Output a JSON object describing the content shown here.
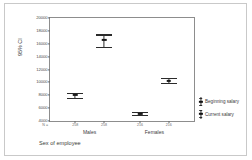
{
  "chart_data": {
    "type": "scatter",
    "title": "",
    "xlabel": "Sex of employee",
    "ylabel": "95% CI",
    "ylim": [
      4000,
      20000
    ],
    "yticks": [
      20000,
      18000,
      16000,
      14000,
      12000,
      10000,
      8000,
      6000,
      4000
    ],
    "ytick_labels": [
      "20000",
      "18000",
      "16000",
      "14000",
      "12000",
      "10000",
      "8000",
      "6000",
      "4000"
    ],
    "grid": false,
    "legend_position": "right",
    "n_prefix": "N =",
    "categories": [
      "Males",
      "Females"
    ],
    "series": [
      {
        "name": "Beginning salary",
        "n": [
          "258",
          "216"
        ],
        "means": [
          8000,
          5150
        ],
        "ci_lower": [
          7600,
          4950
        ],
        "ci_upper": [
          8400,
          5350
        ]
      },
      {
        "name": "Current salary",
        "n": [
          "258",
          "216"
        ],
        "means": [
          16600,
          10250
        ],
        "ci_lower": [
          15550,
          9900
        ],
        "ci_upper": [
          17450,
          10700
        ]
      }
    ],
    "points": [
      {
        "group": "Males",
        "series": "Beginning salary",
        "n": "258",
        "mean": 8000,
        "low": 7600,
        "high": 8400
      },
      {
        "group": "Males",
        "series": "Current salary",
        "n": "258",
        "mean": 16600,
        "low": 15550,
        "high": 17450
      },
      {
        "group": "Females",
        "series": "Beginning salary",
        "n": "216",
        "mean": 5150,
        "low": 4950,
        "high": 5350
      },
      {
        "group": "Females",
        "series": "Current salary",
        "n": "216",
        "mean": 10250,
        "low": 9900,
        "high": 10700
      }
    ],
    "colors": {
      "marker": "#1a1a1a",
      "axis": "#8d8d8d",
      "text": "#3b3b3b",
      "frame": "#c9c9c9"
    }
  },
  "legend": {
    "items": [
      {
        "label": "Beginning salary"
      },
      {
        "label": "Current salary"
      }
    ]
  }
}
